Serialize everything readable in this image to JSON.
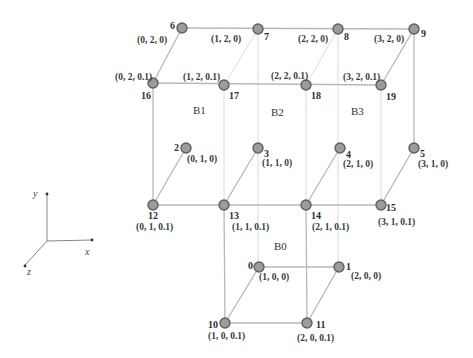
{
  "diagram": {
    "nodes": [
      {
        "id": "0",
        "coord": "(1, 0, 0)"
      },
      {
        "id": "1",
        "coord": "(2, 0, 0)"
      },
      {
        "id": "2",
        "coord": "(0, 1, 0)"
      },
      {
        "id": "3",
        "coord": "(1, 1, 0)"
      },
      {
        "id": "4",
        "coord": "(2, 1, 0)"
      },
      {
        "id": "5",
        "coord": "(3, 1, 0)"
      },
      {
        "id": "6",
        "coord": "(0, 2, 0)"
      },
      {
        "id": "7",
        "coord": "(1, 2, 0)"
      },
      {
        "id": "8",
        "coord": "(2, 2, 0)"
      },
      {
        "id": "9",
        "coord": "(3, 2, 0)"
      },
      {
        "id": "10",
        "coord": "(1, 0, 0.1)"
      },
      {
        "id": "11",
        "coord": "(2, 0, 0.1)"
      },
      {
        "id": "12",
        "coord": "(0, 1, 0.1)"
      },
      {
        "id": "13",
        "coord": "(1, 1, 0.1)"
      },
      {
        "id": "14",
        "coord": "(2, 1, 0.1)"
      },
      {
        "id": "15",
        "coord": "(3, 1, 0.1)"
      },
      {
        "id": "16",
        "coord": "(0, 2, 0.1)"
      },
      {
        "id": "17",
        "coord": "(1, 2, 0.1)"
      },
      {
        "id": "18",
        "coord": "(2, 2, 0.1)"
      },
      {
        "id": "19",
        "coord": "(3, 2, 0.1)"
      }
    ],
    "blocks": [
      "B0",
      "B1",
      "B2",
      "B3"
    ],
    "axes": {
      "x": "x",
      "y": "y",
      "z": "z"
    }
  }
}
